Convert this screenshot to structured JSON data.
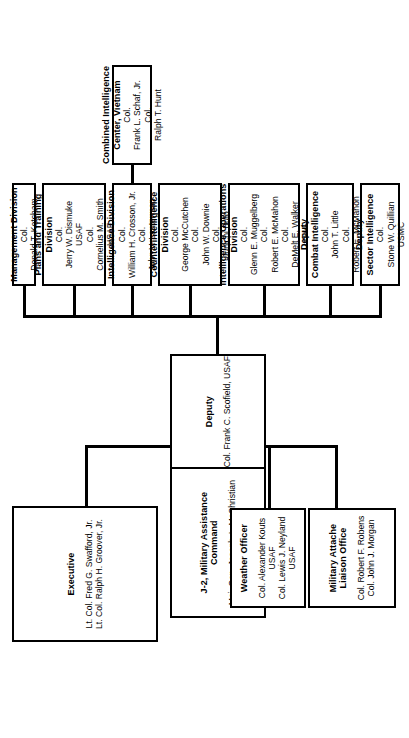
{
  "chart_title": "J-2, Military Assistance Command Organization",
  "root": {
    "title_line1": "J-2, Military Assistance",
    "title_line2": "Command",
    "name1": "Maj. Gen. Joseph A. McChristian",
    "deputy_label": "Deputy",
    "deputy_name": "Col. Frank C. Scofield, USAF"
  },
  "executive": {
    "title": "Executive",
    "name1": "Lt. Col. Fred G. Swafford, Jr.",
    "name2": "Lt. Col. Ralph H. Groover, Jr."
  },
  "weather": {
    "title": "Weather Officer",
    "name1": "Col. Alexander Kouts",
    "svc1": "USAF",
    "name2": "Col. Lewis J. Neyland",
    "svc2": "USAF"
  },
  "attache": {
    "title_line1": "Military Attache",
    "title_line2": "Liaison Office",
    "name1": "Col. Robert F. Robens",
    "name2": "Col. John J. Morgan"
  },
  "divisions": [
    {
      "id": "management-division",
      "title_line1": "Management Division",
      "title_line2": "",
      "entries": [
        {
          "rank": "Col.",
          "name": "Donald T. Ketcham",
          "svc": ""
        }
      ]
    },
    {
      "id": "plans-and-training-division",
      "title_line1": "Plans and Training",
      "title_line2": "Division",
      "entries": [
        {
          "rank": "Col.",
          "name": "Jerry W. Dismuke",
          "svc": "USAF"
        },
        {
          "rank": "Col.",
          "name": "Cornelius M. Smith",
          "svc": "USAF"
        }
      ]
    },
    {
      "id": "intelligence-division",
      "title_line1": "Intelligence Division",
      "title_line2": "",
      "entries": [
        {
          "rank": "Col.",
          "name": "William H. Crosson, Jr.",
          "svc": ""
        },
        {
          "rank": "Col.",
          "name": "John V. Lanterman",
          "svc": ""
        }
      ]
    },
    {
      "id": "counterintelligence-division",
      "title_line1": "Counterintelligence",
      "title_line2": "Division",
      "entries": [
        {
          "rank": "Col.",
          "name": "George McCutchen",
          "svc": ""
        },
        {
          "rank": "Col.",
          "name": "John W. Downie",
          "svc": ""
        },
        {
          "rank": "Col.",
          "name": "Junichi Buto",
          "svc": ""
        }
      ]
    },
    {
      "id": "intelligence-operations-division",
      "title_line1": "Intelligence Operations",
      "title_line2": "Division",
      "entries": [
        {
          "rank": "Col.",
          "name": "Glenn E. Muggelberg",
          "svc": ""
        },
        {
          "rank": "Col.",
          "name": "Robert E. McMahon",
          "svc": ""
        },
        {
          "rank": "Col.",
          "name": "DeMelt E. Walker",
          "svc": "USAF"
        }
      ]
    },
    {
      "id": "deputy-combat-intelligence",
      "title_line1": "Deputy",
      "title_line2": "Combat Intelligence",
      "entries": [
        {
          "rank": "Col.",
          "name": "John T. Little",
          "svc": ""
        },
        {
          "rank": "Col.",
          "name": "Robert E. McMahon",
          "svc": ""
        }
      ]
    },
    {
      "id": "deputy-sector-intelligence",
      "title_line1": "Deputy",
      "title_line2": "Sector Intelligence",
      "entries": [
        {
          "rank": "Col.",
          "name": "Stone W. Quillian",
          "svc": "USMC"
        }
      ]
    }
  ],
  "cic": {
    "title_line1": "Combined Intelligence",
    "title_line2": "Center, Vietnam",
    "entries": [
      {
        "rank": "Col.",
        "name": "Frank L. Schaf, Jr.",
        "svc": ""
      },
      {
        "rank": "Col.",
        "name": "Ralph T. Hunt",
        "svc": ""
      }
    ]
  }
}
